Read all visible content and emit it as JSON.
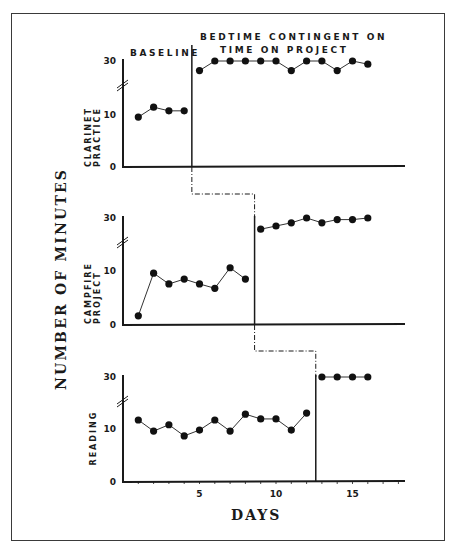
{
  "chart_data": {
    "type": "line",
    "title": "",
    "xlabel": "DAYS",
    "ylabel": "NUMBER OF MINUTES",
    "x_ticks": [
      5,
      10,
      15
    ],
    "x_range": [
      0,
      18
    ],
    "design": "multiple-baseline",
    "phase_labels": {
      "baseline": "BASELINE",
      "treatment_line1": "BEDTIME CONTINGENT ON",
      "treatment_line2": "TIME ON PROJECT"
    },
    "panels": [
      {
        "label_line1": "CLARINET",
        "label_line2": "PRACTICE",
        "y_ticks": [
          0,
          10,
          30
        ],
        "axis_break": true,
        "phase_change_after_day": 4.5,
        "baseline": {
          "x": [
            1,
            2,
            3,
            4
          ],
          "y": [
            9.6,
            11.5,
            10.8,
            10.8
          ]
        },
        "treatment": {
          "x": [
            5,
            6,
            7,
            8,
            9,
            10,
            11,
            12,
            13,
            14,
            15,
            16
          ],
          "y": [
            27,
            30,
            30,
            30,
            30,
            30,
            27,
            30,
            30,
            27,
            30,
            29
          ]
        }
      },
      {
        "label_line1": "CAMPFIRE",
        "label_line2": "PROJECT",
        "y_ticks": [
          0,
          10,
          30
        ],
        "axis_break": true,
        "phase_change_after_day": 8.6,
        "baseline": {
          "x": [
            1,
            2,
            3,
            4,
            5,
            6,
            7,
            8
          ],
          "y": [
            1.7,
            9.6,
            7.6,
            8.5,
            7.6,
            6.8,
            10.6,
            8.5
          ]
        },
        "treatment": {
          "x": [
            9,
            10,
            11,
            12,
            13,
            14,
            15,
            16
          ],
          "y": [
            26.5,
            27.5,
            28.5,
            30,
            28.5,
            29.5,
            29.5,
            30
          ]
        }
      },
      {
        "label_line1": "READING",
        "label_line2": "",
        "y_ticks": [
          0,
          10,
          30
        ],
        "axis_break": true,
        "phase_change_after_day": 12.6,
        "baseline": {
          "x": [
            1,
            2,
            3,
            4,
            5,
            6,
            7,
            8,
            9,
            10,
            11,
            12
          ],
          "y": [
            11.7,
            9.6,
            10.8,
            8.7,
            9.8,
            11.7,
            9.6,
            12.8,
            11.9,
            11.9,
            9.8,
            13.0
          ]
        },
        "treatment": {
          "x": [
            13,
            14,
            15,
            16
          ],
          "y": [
            30,
            30,
            30,
            30
          ]
        }
      }
    ]
  }
}
